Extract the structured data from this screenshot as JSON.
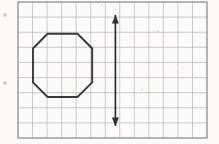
{
  "figure": {
    "title": "Octagon with vertical line of symmetry on grid",
    "background_color": "#fdfdfd",
    "paper_tint": "#fcfbf9"
  },
  "grid": {
    "name": "graph-paper-grid",
    "x": 18,
    "y": 2,
    "width": 189,
    "height": 136,
    "columns": 13,
    "rows": 9,
    "cell_width": 14.54,
    "cell_height": 15.11,
    "line_color": "#b9bcc2",
    "line_width": 0.8,
    "border_color": "#8d9096",
    "border_width": 1.3
  },
  "shapes": {
    "octagon": {
      "name": "octagon",
      "stroke_color": "#3a3a3c",
      "stroke_width": 1.9,
      "fill": "none",
      "sides": 8,
      "points": [
        [
          47.5,
          33.8
        ],
        [
          77.5,
          33.8
        ],
        [
          92.2,
          48.5
        ],
        [
          92.2,
          82.3
        ],
        [
          77.5,
          97.0
        ],
        [
          47.5,
          97.0
        ],
        [
          33.0,
          82.3
        ],
        [
          33.0,
          48.5
        ]
      ]
    },
    "symmetry_arrow": {
      "name": "line-of-symmetry-arrow",
      "stroke_color": "#2f2f31",
      "stroke_width": 1.7,
      "x": 115.4,
      "y_top": 15.0,
      "y_bottom": 126.0,
      "arrowhead_length": 8.5,
      "arrowhead_width": 7.0,
      "double_headed": true
    }
  },
  "artifacts": {
    "name": "scan-speckles",
    "color": "#b6b6b8",
    "marks": [
      {
        "x": 3.5,
        "y": 13.5,
        "w": 3.2,
        "h": 3.2
      },
      {
        "x": 3.5,
        "y": 81.5,
        "w": 3.2,
        "h": 3.2
      },
      {
        "x": 101.0,
        "y": 4.0,
        "w": 1.4,
        "h": 1.4
      },
      {
        "x": 157.0,
        "y": 31.0,
        "w": 1.4,
        "h": 1.4
      },
      {
        "x": 141.0,
        "y": 89.0,
        "w": 1.4,
        "h": 1.4
      },
      {
        "x": 182.0,
        "y": 67.0,
        "w": 1.2,
        "h": 1.2
      }
    ]
  }
}
